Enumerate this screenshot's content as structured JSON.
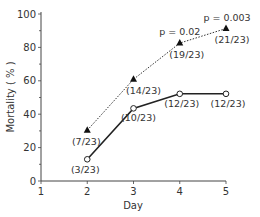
{
  "chart_data": {
    "type": "line",
    "title": "",
    "xlabel": "Day",
    "ylabel": "Mortality ( % )",
    "xlim": [
      1,
      5
    ],
    "ylim": [
      0,
      100
    ],
    "x_ticks": [
      1,
      2,
      3,
      4,
      5
    ],
    "y_ticks": [
      0,
      20,
      40,
      60,
      80,
      100
    ],
    "grid": false,
    "legend": null,
    "x": [
      2,
      3,
      4,
      5
    ],
    "series": [
      {
        "name": "dashed-triangle",
        "line_style": "dotted",
        "marker": "filled-triangle",
        "values": [
          30.4,
          60.9,
          82.6,
          91.3
        ],
        "labels": [
          "(7/23)",
          "(14/23)",
          "(19/23)",
          "(21/23)"
        ]
      },
      {
        "name": "solid-circle",
        "line_style": "solid",
        "marker": "open-circle",
        "values": [
          13.0,
          43.5,
          52.2,
          52.2
        ],
        "labels": [
          "(3/23)",
          "(10/23)",
          "(12/23)",
          "(12/23)"
        ]
      }
    ],
    "annotations": [
      {
        "x": 4,
        "text": "p = 0.02"
      },
      {
        "x": 5,
        "text": "p = 0.003"
      }
    ]
  }
}
